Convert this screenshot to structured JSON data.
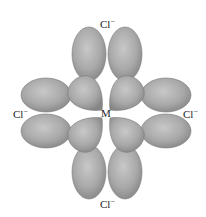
{
  "diagram": {
    "center_label": "M",
    "ligands": {
      "top": {
        "symbol": "Cl",
        "charge": "−"
      },
      "left": {
        "symbol": "Cl",
        "charge": "−"
      },
      "right": {
        "symbol": "Cl",
        "charge": "−"
      },
      "bottom": {
        "symbol": "Cl",
        "charge": "−"
      }
    },
    "colors": {
      "lobe_fill_light": "#bdbdbd",
      "lobe_fill_dark": "#8a8a8a",
      "lobe_edge": "#7a7a7a",
      "background": "#ffffff"
    }
  }
}
